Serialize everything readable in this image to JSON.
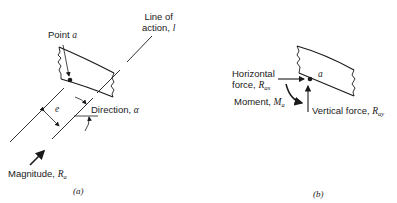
{
  "panel_a": {
    "caption": "(a)",
    "point_label": "Point",
    "point_symbol": "a",
    "line_of_action_line1": "Line of",
    "line_of_action_line2": "action,",
    "line_symbol": "l",
    "eccentricity_symbol": "e",
    "direction_label": "Direction,",
    "direction_symbol": "α",
    "magnitude_label": "Magnitude,",
    "magnitude_symbol": "R",
    "magnitude_subscript": "a"
  },
  "panel_b": {
    "caption": "(b)",
    "point_symbol": "a",
    "horizontal_line1": "Horizontal",
    "horizontal_line2": "force,",
    "horizontal_symbol": "R",
    "horizontal_subscript": "ax",
    "moment_label": "Moment,",
    "moment_symbol": "M",
    "moment_subscript": "a",
    "vertical_label": "Vertical force,",
    "vertical_symbol": "R",
    "vertical_subscript": "ay"
  },
  "colors": {
    "ink": "#1a1a1a",
    "background": "#ffffff"
  }
}
